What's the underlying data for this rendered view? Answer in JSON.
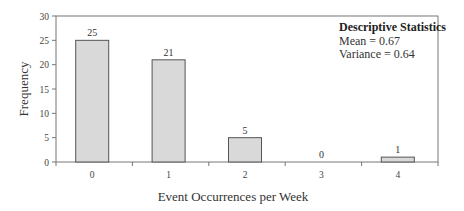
{
  "chart_data": {
    "type": "bar",
    "title": "",
    "xlabel": "Event Occurrences per Week",
    "ylabel": "Frequency",
    "categories": [
      "0",
      "1",
      "2",
      "3",
      "4"
    ],
    "values": [
      25,
      21,
      5,
      0,
      1
    ],
    "value_labels": [
      "25",
      "21",
      "5",
      "0",
      "1"
    ],
    "ylim": [
      0,
      30
    ],
    "yticks": [
      0,
      5,
      10,
      15,
      20,
      25,
      30
    ],
    "ytick_labels": [
      "0",
      "5",
      "10",
      "15",
      "20",
      "25",
      "30"
    ],
    "grid": false,
    "bar_color": "#d9d9d9",
    "bar_edge_color": "#555555",
    "annotation": {
      "title": "Descriptive Statistics",
      "lines": [
        "Mean = 0.67",
        "Variance = 0.64"
      ]
    }
  }
}
